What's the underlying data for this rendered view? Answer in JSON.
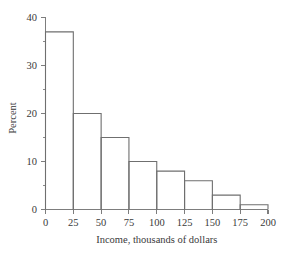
{
  "chart_data": {
    "type": "bar",
    "title": "",
    "subtitle": "",
    "xlabel": "Income, thousands of dollars",
    "ylabel": "Percent",
    "categories": [
      "0-25",
      "25-50",
      "50-75",
      "75-100",
      "100-125",
      "125-150",
      "150-175",
      "175-200"
    ],
    "bin_edges": [
      0,
      25,
      50,
      75,
      100,
      125,
      150,
      175,
      200
    ],
    "values": [
      37,
      20,
      15,
      10,
      8,
      6,
      3,
      1
    ],
    "xlim": [
      0,
      200
    ],
    "ylim": [
      0,
      40
    ],
    "x_ticks": [
      0,
      25,
      50,
      75,
      100,
      125,
      150,
      175,
      200
    ],
    "x_tick_labels": [
      "0",
      "25",
      "50",
      "75",
      "100",
      "125",
      "150",
      "175",
      "200"
    ],
    "y_ticks": [
      0,
      10,
      20,
      30,
      40
    ],
    "y_tick_labels": [
      "0",
      "10",
      "20",
      "30",
      "40"
    ],
    "y_minor_ticks": [
      5,
      15,
      25,
      35
    ],
    "grid": false,
    "legend": false,
    "legend_position": "none",
    "bar_style": "outline",
    "colors": {
      "background": "#ffffff",
      "bar_stroke": "#6f6f6f",
      "axis": "#7d7d7d",
      "text": "#3a3a3a"
    }
  }
}
